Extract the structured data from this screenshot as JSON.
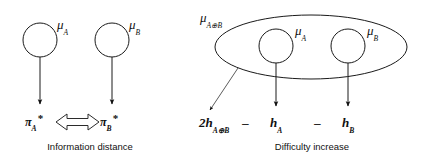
{
  "figure": {
    "background_color": "#ffffff",
    "stroke_color": "#1a1a1a",
    "panels": [
      {
        "id": "left-panel",
        "caption": "Information distance",
        "nodes": [
          {
            "id": "mu-a",
            "label_base": "μ",
            "label_sub": "A"
          },
          {
            "id": "mu-b",
            "label_base": "μ",
            "label_sub": "B"
          }
        ],
        "outputs": [
          {
            "id": "pi-a-star",
            "label_base": "π",
            "label_sub": "A",
            "label_sup": "*"
          },
          {
            "id": "pi-b-star",
            "label_base": "π",
            "label_sub": "B",
            "label_sup": "*"
          }
        ],
        "connector": "double-headed-block-arrow"
      },
      {
        "id": "right-panel",
        "caption": "Difficulty increase",
        "container": {
          "id": "mu-ab",
          "label_base": "μ",
          "label_sub": "A⊕B"
        },
        "nodes": [
          {
            "id": "mu-a-inner",
            "label_base": "μ",
            "label_sub": "A"
          },
          {
            "id": "mu-b-inner",
            "label_base": "μ",
            "label_sub": "B"
          }
        ],
        "expression": {
          "term_1_prefix": "2",
          "term_1_base": "h",
          "term_1_sub": "A⊕B",
          "operator_1": "–",
          "term_2_base": "h",
          "term_2_sub": "A",
          "operator_2": "–",
          "term_3_base": "h",
          "term_3_sub": "B"
        }
      }
    ]
  },
  "labels": {
    "mu": "μ",
    "pi": "π",
    "h": "h",
    "star": "*",
    "sub_a": "A",
    "sub_b": "B",
    "sub_ab": "A⊕B",
    "two": "2",
    "minus": "–",
    "caption_left": "Information distance",
    "caption_right": "Difficulty increase"
  }
}
